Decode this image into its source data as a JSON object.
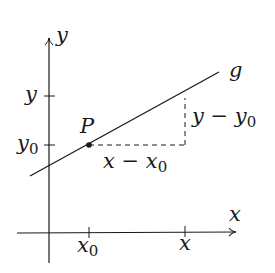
{
  "diagram": {
    "title": "",
    "axes": {
      "x_label": "x",
      "y_label": "y"
    },
    "ticks": {
      "x0": {
        "base": "x",
        "sub": "0"
      },
      "x": {
        "base": "x"
      },
      "y0": {
        "base": "y",
        "sub": "0"
      },
      "y": {
        "base": "y"
      }
    },
    "point": {
      "label": "P"
    },
    "line": {
      "label": "g"
    },
    "annotations": {
      "dx": {
        "a": "x",
        "op": " − ",
        "b": "x",
        "b_sub": "0"
      },
      "dy": {
        "a": "y",
        "op": " − ",
        "b": "y",
        "b_sub": "0"
      }
    },
    "colors": {
      "stroke": "#1a1a1a",
      "background": "#ffffff"
    }
  }
}
